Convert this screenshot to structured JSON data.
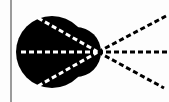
{
  "diagram": {
    "type": "ray-diagram",
    "background": "#fdfdfd",
    "boundary_line": {
      "x": 11,
      "color": "#7a7a7a"
    },
    "blob": {
      "color": "#000000",
      "main_circle": {
        "cx": 52,
        "cy": 52,
        "r": 36
      },
      "right_bulge": {
        "cx": 76,
        "cy": 52,
        "r": 25
      }
    },
    "focal_point": {
      "x": 98,
      "y": 52
    },
    "rays_inside": {
      "color": "#ffffff",
      "targets": [
        {
          "x": 38,
          "y": 18
        },
        {
          "x": 18,
          "y": 52
        },
        {
          "x": 38,
          "y": 86
        }
      ]
    },
    "rays_outside": {
      "color": "#000000",
      "targets": [
        {
          "x": 166,
          "y": 16
        },
        {
          "x": 169,
          "y": 52
        },
        {
          "x": 164,
          "y": 88
        }
      ]
    },
    "dash_pattern": "5 3"
  }
}
